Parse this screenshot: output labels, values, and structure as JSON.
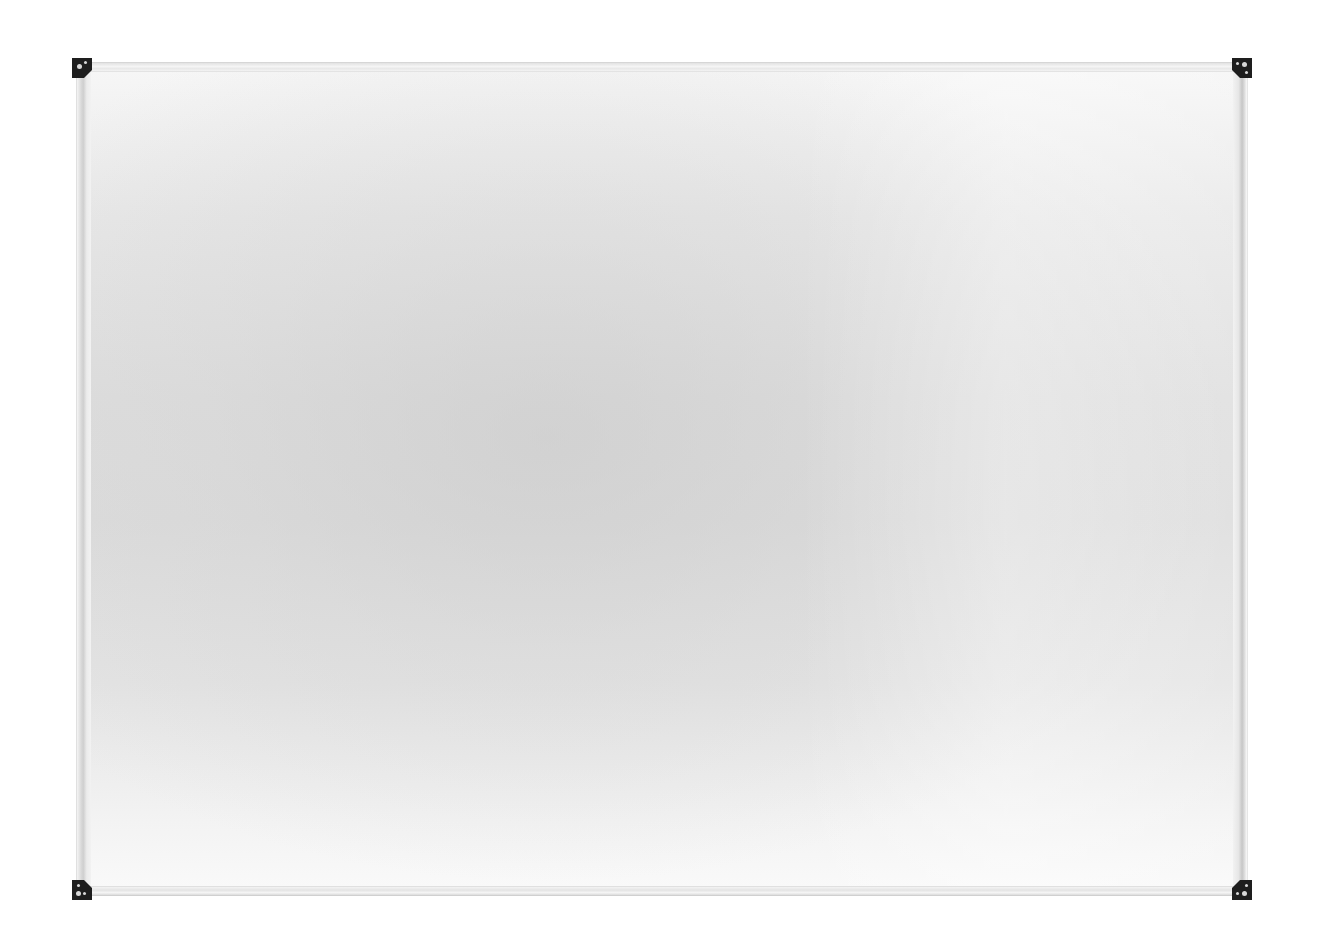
{
  "scene": {
    "subject": "blank whiteboard",
    "background_color": "#ffffff"
  },
  "whiteboard": {
    "frame_color": "#d9d9d9",
    "surface_color": "#e2e2e2",
    "corner_cap_color": "#1e1e1e",
    "corners": [
      "top-left",
      "top-right",
      "bottom-left",
      "bottom-right"
    ]
  }
}
